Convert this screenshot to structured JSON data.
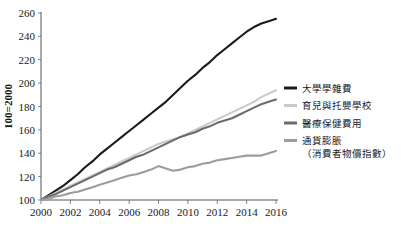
{
  "chart_data": {
    "type": "line",
    "title": "",
    "xlabel": "",
    "ylabel": "100=2000",
    "xlim": [
      2000,
      2016
    ],
    "ylim": [
      100,
      260
    ],
    "grid": false,
    "legend_position": "right",
    "xticks": [
      "2000",
      "2002",
      "2004",
      "2006",
      "2008",
      "2010",
      "2012",
      "2014",
      "2016"
    ],
    "yticks": [
      "100",
      "120",
      "140",
      "160",
      "180",
      "200",
      "220",
      "240",
      "260"
    ],
    "x": [
      2000,
      2000.5,
      2001,
      2001.5,
      2002,
      2002.5,
      2003,
      2003.5,
      2004,
      2004.5,
      2005,
      2005.5,
      2006,
      2006.5,
      2007,
      2007.5,
      2008,
      2008.5,
      2009,
      2009.5,
      2010,
      2010.5,
      2011,
      2011.5,
      2012,
      2012.5,
      2013,
      2013.5,
      2014,
      2014.5,
      2015,
      2015.5,
      2016
    ],
    "series": [
      {
        "name": "大學學雜費",
        "color": "#1a1a1a",
        "width": 2.1,
        "values": [
          100,
          104,
          108,
          112,
          117,
          122,
          128,
          133,
          139,
          144,
          149,
          154,
          159,
          164,
          169,
          174,
          179,
          184,
          190,
          196,
          202,
          207,
          213,
          218,
          224,
          229,
          234,
          239,
          244,
          248,
          251,
          253,
          255
        ]
      },
      {
        "name": "育兒與托嬰學校",
        "color": "#c9c9c9",
        "width": 2.1,
        "values": [
          100,
          103,
          106,
          109,
          112,
          115,
          118,
          121,
          124,
          127,
          130,
          133,
          136,
          139,
          142,
          145,
          148,
          150,
          152,
          154,
          157,
          160,
          163,
          166,
          169,
          172,
          175,
          178,
          181,
          184,
          188,
          191,
          194
        ]
      },
      {
        "name": "醫療保健費用",
        "color": "#6b6b6b",
        "width": 2.1,
        "values": [
          100,
          103,
          105,
          108,
          111,
          114,
          117,
          120,
          123,
          126,
          128,
          131,
          134,
          137,
          139,
          142,
          145,
          148,
          151,
          154,
          156,
          158,
          161,
          163,
          166,
          168,
          170,
          173,
          176,
          179,
          182,
          184,
          186
        ]
      },
      {
        "name": "通貨膨脹",
        "color": "#9c9c9c",
        "width": 2.1,
        "values": [
          100,
          101,
          103,
          104,
          106,
          107,
          109,
          111,
          113,
          115,
          117,
          119,
          121,
          122,
          124,
          126,
          129,
          127,
          125,
          126,
          128,
          129,
          131,
          132,
          134,
          135,
          136,
          137,
          138,
          138,
          138,
          140,
          142
        ]
      }
    ],
    "legend": [
      {
        "label": "大學學雜費",
        "sublabel": "",
        "color": "#1a1a1a"
      },
      {
        "label": "育兒與托嬰學校",
        "sublabel": "",
        "color": "#c9c9c9"
      },
      {
        "label": "醫療保健費用",
        "sublabel": "",
        "color": "#6b6b6b"
      },
      {
        "label": "通貨膨脹",
        "sublabel": "（消費者物價指數）",
        "color": "#9c9c9c"
      }
    ]
  }
}
